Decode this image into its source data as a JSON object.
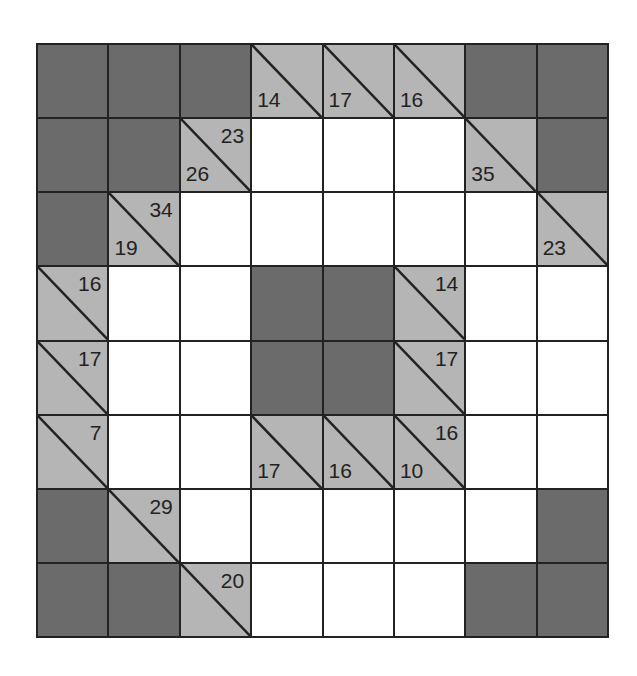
{
  "puzzle": {
    "type": "kakuro",
    "rows": 8,
    "cols": 8,
    "colors": {
      "block": "#6b6b6b",
      "clue": "#b5b5b5",
      "empty": "#ffffff",
      "line": "#222222"
    },
    "cells": [
      [
        {
          "t": "B"
        },
        {
          "t": "B"
        },
        {
          "t": "B"
        },
        {
          "t": "C",
          "down": "14"
        },
        {
          "t": "C",
          "down": "17"
        },
        {
          "t": "C",
          "down": "16"
        },
        {
          "t": "B"
        },
        {
          "t": "B"
        }
      ],
      [
        {
          "t": "B"
        },
        {
          "t": "B"
        },
        {
          "t": "C",
          "across": "23",
          "down": "26"
        },
        {
          "t": "W"
        },
        {
          "t": "W"
        },
        {
          "t": "W"
        },
        {
          "t": "C",
          "down": "35"
        },
        {
          "t": "B"
        }
      ],
      [
        {
          "t": "B"
        },
        {
          "t": "C",
          "across": "34",
          "down": "19"
        },
        {
          "t": "W"
        },
        {
          "t": "W"
        },
        {
          "t": "W"
        },
        {
          "t": "W"
        },
        {
          "t": "W"
        },
        {
          "t": "C",
          "down": "23"
        }
      ],
      [
        {
          "t": "C",
          "across": "16"
        },
        {
          "t": "W"
        },
        {
          "t": "W"
        },
        {
          "t": "B"
        },
        {
          "t": "B"
        },
        {
          "t": "C",
          "across": "14"
        },
        {
          "t": "W"
        },
        {
          "t": "W"
        }
      ],
      [
        {
          "t": "C",
          "across": "17"
        },
        {
          "t": "W"
        },
        {
          "t": "W"
        },
        {
          "t": "B"
        },
        {
          "t": "B"
        },
        {
          "t": "C",
          "across": "17"
        },
        {
          "t": "W"
        },
        {
          "t": "W"
        }
      ],
      [
        {
          "t": "C",
          "across": "7"
        },
        {
          "t": "W"
        },
        {
          "t": "W"
        },
        {
          "t": "C",
          "down": "17"
        },
        {
          "t": "C",
          "down": "16"
        },
        {
          "t": "C",
          "across": "16",
          "down": "10"
        },
        {
          "t": "W"
        },
        {
          "t": "W"
        }
      ],
      [
        {
          "t": "B"
        },
        {
          "t": "C",
          "across": "29"
        },
        {
          "t": "W"
        },
        {
          "t": "W"
        },
        {
          "t": "W"
        },
        {
          "t": "W"
        },
        {
          "t": "W"
        },
        {
          "t": "B"
        }
      ],
      [
        {
          "t": "B"
        },
        {
          "t": "B"
        },
        {
          "t": "C",
          "across": "20"
        },
        {
          "t": "W"
        },
        {
          "t": "W"
        },
        {
          "t": "W"
        },
        {
          "t": "B"
        },
        {
          "t": "B"
        }
      ]
    ]
  }
}
